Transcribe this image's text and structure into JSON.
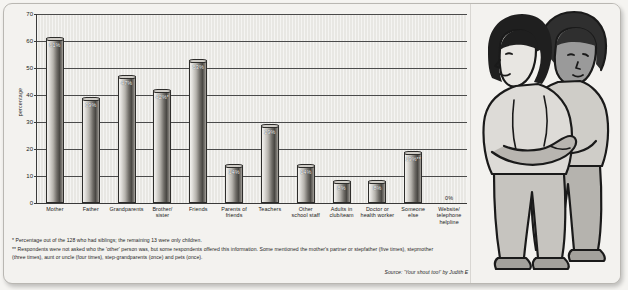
{
  "chart_data": {
    "type": "bar",
    "title": "",
    "xlabel": "",
    "ylabel": "percentage",
    "ylim": [
      0,
      70
    ],
    "yticks": [
      0,
      10,
      20,
      30,
      40,
      50,
      60,
      70
    ],
    "grid": true,
    "legend": "none",
    "categories": [
      "Mother",
      "Father",
      "Grandparents",
      "Brother/ sister",
      "Friends",
      "Parents of friends",
      "Teachers",
      "Other school staff",
      "Adults in club/team",
      "Doctor or health worker",
      "Someone else",
      "Website/ telephone helpline"
    ],
    "category_lines": [
      [
        "Mother"
      ],
      [
        "Father"
      ],
      [
        "Grandparents"
      ],
      [
        "Brother/",
        "sister"
      ],
      [
        "Friends"
      ],
      [
        "Parents of",
        "friends"
      ],
      [
        "Teachers"
      ],
      [
        "Other",
        "school staff"
      ],
      [
        "Adults in",
        "club/team"
      ],
      [
        "Doctor or",
        "health worker"
      ],
      [
        "Someone",
        "else"
      ],
      [
        "Website/",
        "telephone helpline"
      ]
    ],
    "values": [
      61,
      39,
      47,
      42,
      53,
      14,
      29,
      14,
      8,
      8,
      19,
      0
    ],
    "value_labels": [
      "61%",
      "39%",
      "47%",
      "42%*",
      "53%",
      "14%",
      "29%",
      "14%",
      "8%",
      "8%",
      "19%**",
      "0%"
    ]
  },
  "axis": {
    "y_title": "percentage"
  },
  "footnotes": {
    "line1": "* Percentage out of the 128 who had siblings; the remaining 13 were only children.",
    "line2": "** Respondents were not asked who the 'other' person was, but some respondents offered this information. Some mentioned the mother's partner or stepfather (five times), stepmother",
    "line3": "(three times), aunt or uncle (four times), step-grandparents (once) and pets (once)."
  },
  "source": {
    "text": "Source: 'Your shout too!' by Judith E Timms, Sue Bailey and Jane Thorburn. Copyright NSPCC 2007"
  },
  "illustration": {
    "alt": "two-people-hugging-illustration"
  },
  "colors": {
    "page_background": "#f3f2ef",
    "plot_background": "#e8e7e3",
    "bar_dark": "#4a4844",
    "bar_light": "#f2f1ee",
    "axis": "#3a3a3a",
    "text": "#1e1e1e"
  }
}
